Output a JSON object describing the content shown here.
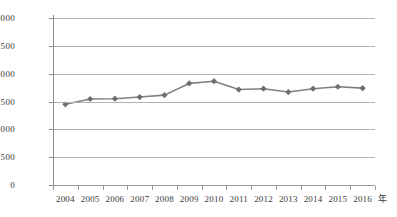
{
  "chart_data": {
    "type": "line",
    "title": "",
    "subtitle": "",
    "xlabel": "年",
    "ylabel": "",
    "categories": [
      "2004",
      "2005",
      "2006",
      "2007",
      "2008",
      "2009",
      "2010",
      "2011",
      "2012",
      "2013",
      "2014",
      "2015",
      "2016"
    ],
    "values": [
      1450,
      1545,
      1550,
      1580,
      1615,
      1825,
      1865,
      1715,
      1730,
      1670,
      1730,
      1765,
      1740
    ],
    "series": [
      {
        "name": "",
        "values": [
          1450,
          1545,
          1550,
          1580,
          1615,
          1825,
          1865,
          1715,
          1730,
          1670,
          1730,
          1765,
          1740
        ]
      }
    ],
    "ylim": [
      0,
      3000
    ],
    "ytick_values": [
      0,
      500,
      1000,
      1500,
      2000,
      2500,
      3000
    ],
    "ytick_labels": [
      "0",
      "500",
      "1000",
      "1500",
      "2000",
      "2500",
      "3000"
    ],
    "xtick_labels": [
      "2004",
      "2005",
      "2006",
      "2007",
      "2008",
      "2009",
      "2010",
      "2011",
      "2012",
      "2013",
      "2014",
      "2015",
      "2016"
    ],
    "grid": true,
    "grid_axis": "y",
    "legend": false,
    "legend_position": "none",
    "marker": "diamond",
    "line_color": "#808080",
    "marker_color": "#6e6e6e",
    "grid_color": "#b3b3b3",
    "axis_color": "#8c8c8c",
    "background_color": "#ffffff",
    "text_color": "#3a3a3a"
  }
}
